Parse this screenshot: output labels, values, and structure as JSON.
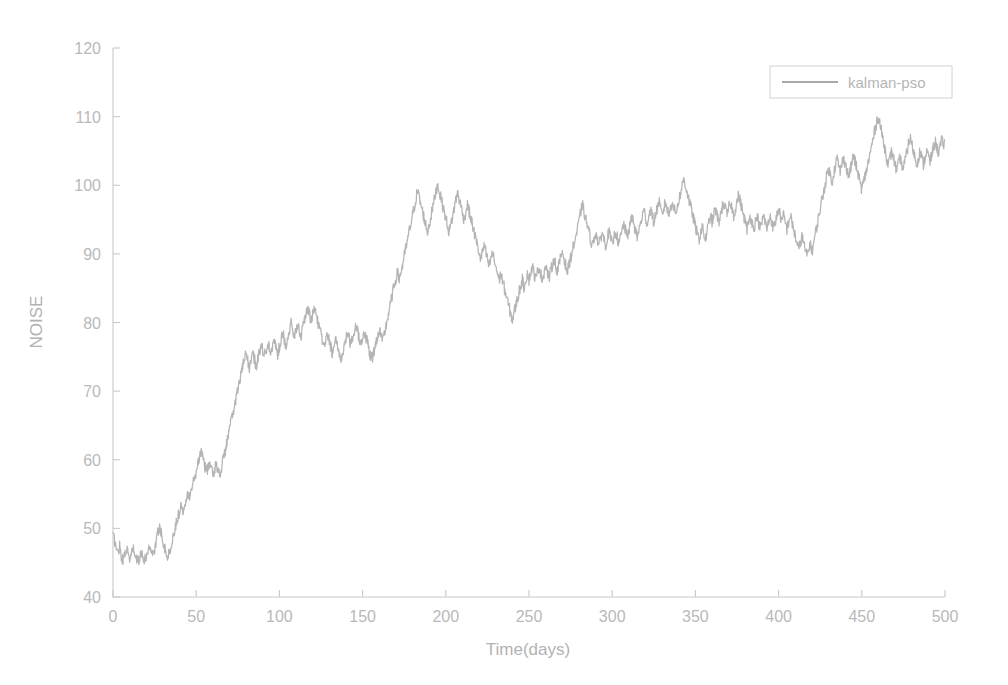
{
  "figure": {
    "background_color": "#ffffff",
    "axis_color": "#c9c9c9",
    "text_color": "#b9b9b9"
  },
  "chart_data": {
    "type": "line",
    "title": "",
    "xlabel": "Time(days)",
    "ylabel": "NOISE",
    "xlim": [
      0,
      500
    ],
    "ylim": [
      40,
      120
    ],
    "xticks": [
      0,
      50,
      100,
      150,
      200,
      250,
      300,
      350,
      400,
      450,
      500
    ],
    "xtick_labels": [
      "0",
      "50",
      "100",
      "150",
      "200",
      "250",
      "300",
      "350",
      "400",
      "450",
      "500"
    ],
    "yticks": [
      40,
      50,
      60,
      70,
      80,
      90,
      100,
      110,
      120
    ],
    "ytick_labels": [
      "40",
      "50",
      "60",
      "70",
      "80",
      "90",
      "100",
      "110",
      "120"
    ],
    "grid": false,
    "legend_position": "upper right",
    "legend_entries": [
      "kalman-pso"
    ],
    "series": [
      {
        "name": "kalman-pso",
        "color": "#b4b4b4",
        "x_start": 0,
        "x_step": 1,
        "values": [
          49.0,
          48.2,
          47.1,
          46.3,
          47.6,
          46.0,
          45.2,
          46.4,
          47.2,
          46.1,
          45.4,
          46.2,
          47.0,
          46.2,
          45.6,
          45.1,
          45.8,
          46.6,
          45.9,
          45.2,
          46.0,
          46.8,
          47.5,
          46.9,
          46.2,
          47.0,
          48.1,
          49.4,
          50.2,
          49.4,
          48.3,
          47.2,
          46.4,
          45.8,
          46.6,
          47.4,
          48.6,
          49.8,
          50.9,
          51.6,
          52.5,
          53.4,
          52.6,
          53.5,
          54.6,
          55.4,
          54.6,
          55.5,
          56.6,
          57.4,
          58.4,
          59.4,
          60.6,
          61.4,
          60.3,
          59.2,
          58.4,
          58.8,
          59.6,
          58.6,
          57.8,
          58.6,
          59.4,
          58.6,
          57.9,
          58.7,
          59.8,
          60.9,
          62.0,
          63.2,
          64.4,
          65.6,
          66.8,
          67.9,
          69.0,
          70.2,
          71.4,
          72.6,
          73.6,
          74.6,
          75.5,
          74.4,
          73.4,
          74.4,
          75.6,
          74.6,
          73.6,
          74.6,
          75.8,
          77.0,
          76.0,
          75.0,
          76.1,
          77.2,
          76.2,
          75.3,
          76.4,
          77.4,
          76.4,
          75.4,
          76.5,
          77.6,
          78.6,
          77.6,
          76.6,
          77.7,
          78.8,
          79.8,
          78.8,
          77.8,
          78.8,
          79.9,
          79.0,
          78.0,
          79.1,
          80.2,
          81.2,
          82.2,
          81.2,
          80.2,
          81.2,
          82.3,
          81.3,
          80.2,
          79.2,
          78.2,
          77.2,
          76.3,
          77.3,
          78.3,
          77.3,
          76.4,
          75.4,
          76.4,
          77.4,
          76.4,
          75.5,
          74.6,
          75.6,
          76.6,
          77.6,
          78.6,
          77.6,
          76.7,
          77.7,
          78.7,
          79.7,
          78.7,
          77.8,
          76.8,
          77.8,
          78.8,
          77.8,
          76.9,
          75.9,
          74.9,
          75.0,
          76.0,
          77.0,
          78.0,
          79.0,
          78.1,
          77.1,
          78.2,
          79.4,
          80.6,
          81.8,
          83.0,
          84.2,
          85.4,
          86.4,
          87.3,
          86.3,
          87.3,
          88.4,
          89.6,
          90.8,
          92.0,
          93.2,
          94.4,
          95.6,
          96.8,
          98.0,
          99.2,
          98.2,
          97.2,
          96.2,
          95.2,
          94.2,
          93.2,
          94.2,
          95.4,
          96.6,
          97.8,
          99.0,
          100.2,
          99.2,
          98.2,
          97.2,
          96.2,
          95.2,
          94.2,
          93.2,
          94.2,
          95.4,
          96.6,
          97.8,
          99.0,
          98.0,
          97.0,
          96.0,
          95.0,
          96.0,
          97.2,
          96.2,
          95.2,
          94.2,
          93.2,
          92.2,
          91.2,
          90.2,
          89.2,
          90.2,
          91.2,
          90.2,
          89.2,
          88.2,
          89.2,
          90.2,
          89.2,
          88.2,
          87.2,
          86.2,
          87.2,
          86.2,
          85.2,
          84.2,
          83.2,
          82.2,
          81.2,
          80.4,
          81.4,
          82.4,
          83.4,
          84.4,
          85.4,
          86.2,
          85.2,
          86.2,
          87.2,
          86.2,
          87.2,
          88.2,
          87.2,
          86.2,
          87.2,
          88.2,
          87.2,
          86.2,
          87.3,
          88.4,
          87.4,
          86.4,
          87.4,
          88.4,
          89.4,
          88.4,
          87.4,
          88.4,
          89.4,
          90.4,
          89.4,
          88.4,
          87.4,
          88.4,
          89.4,
          90.4,
          91.4,
          92.4,
          93.4,
          94.6,
          96.0,
          97.2,
          96.2,
          95.2,
          94.2,
          93.2,
          92.2,
          91.2,
          92.2,
          93.2,
          92.2,
          91.2,
          92.2,
          93.2,
          92.2,
          91.2,
          92.2,
          93.3,
          92.3,
          91.3,
          92.3,
          93.4,
          92.4,
          91.4,
          92.4,
          93.4,
          94.4,
          93.4,
          92.4,
          93.4,
          94.4,
          95.4,
          94.4,
          93.4,
          92.4,
          93.4,
          94.4,
          95.4,
          96.4,
          95.4,
          94.4,
          95.4,
          96.6,
          95.6,
          94.6,
          95.6,
          96.6,
          97.6,
          96.6,
          95.6,
          96.6,
          97.6,
          96.6,
          95.6,
          96.6,
          97.8,
          96.8,
          95.8,
          96.8,
          97.8,
          98.8,
          99.8,
          101.0,
          100.0,
          99.0,
          98.0,
          97.0,
          96.0,
          95.0,
          94.0,
          93.0,
          92.0,
          93.0,
          94.0,
          93.0,
          92.0,
          93.2,
          94.4,
          95.6,
          94.6,
          95.6,
          96.6,
          95.6,
          94.6,
          95.6,
          96.6,
          97.6,
          96.6,
          95.6,
          96.6,
          97.6,
          96.6,
          95.6,
          96.6,
          97.6,
          98.6,
          97.6,
          96.6,
          95.6,
          94.6,
          93.6,
          94.6,
          95.6,
          94.6,
          93.6,
          94.6,
          95.6,
          94.6,
          93.6,
          94.6,
          95.6,
          94.6,
          93.6,
          94.6,
          95.6,
          94.6,
          93.6,
          94.6,
          95.6,
          96.6,
          95.6,
          94.6,
          95.6,
          94.6,
          93.6,
          94.6,
          95.6,
          94.6,
          93.6,
          92.6,
          91.6,
          90.6,
          91.6,
          92.6,
          91.6,
          90.6,
          89.6,
          90.6,
          91.6,
          90.3,
          91.5,
          92.8,
          94.0,
          95.3,
          96.6,
          97.8,
          99.0,
          100.2,
          101.4,
          102.5,
          101.5,
          100.5,
          101.6,
          102.8,
          104.0,
          103.0,
          102.0,
          103.0,
          104.2,
          103.2,
          102.2,
          101.2,
          102.2,
          103.2,
          104.4,
          103.4,
          102.4,
          101.4,
          100.4,
          99.4,
          100.4,
          101.4,
          102.4,
          103.4,
          104.6,
          105.8,
          107.0,
          108.2,
          109.4,
          110.0,
          108.8,
          107.6,
          106.4,
          105.2,
          104.0,
          103.0,
          104.0,
          105.0,
          104.0,
          103.0,
          102.0,
          103.0,
          104.0,
          103.0,
          102.5,
          103.5,
          104.8,
          106.0,
          107.0,
          106.0,
          105.0,
          104.0,
          103.0,
          104.0,
          105.0,
          104.0,
          103.0,
          104.0,
          105.0,
          104.2,
          103.4,
          104.4,
          105.4,
          106.4,
          105.6,
          104.8,
          105.6,
          106.4,
          106.0
        ]
      }
    ],
    "noise_amplitude": 0.85
  },
  "legend": {
    "items": [
      {
        "label": "kalman-pso",
        "color": "#b4b4b4"
      }
    ]
  }
}
